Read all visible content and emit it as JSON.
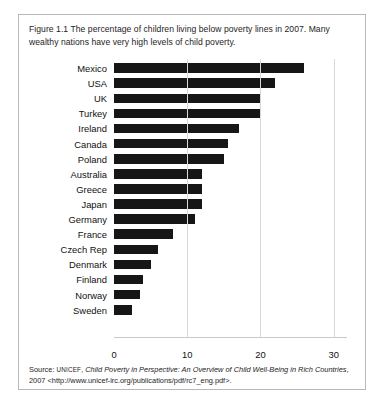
{
  "figure": {
    "caption": "Figure 1.1 The percentage of children living below poverty lines in 2007. Many wealthy nations have very high levels of child poverty.",
    "source_prefix": "Source: ",
    "source_publisher": "UNICEF",
    "source_comma": ", ",
    "source_title": "Child Poverty in Perspective: An Overview of Child Well-Being in Rich Countries",
    "source_year": ", 2007 ",
    "source_url": "<http://www.unicef-irc.org/publications/pdf/rc7_eng.pdf>."
  },
  "chart_data": {
    "type": "bar",
    "orientation": "horizontal",
    "title": "Figure 1.1 The percentage of children living below poverty lines in 2007. Many wealthy nations have very high levels of child poverty.",
    "xlabel": "",
    "ylabel": "",
    "xlim": [
      0,
      34
    ],
    "xticks": [
      0,
      10,
      20,
      30
    ],
    "xtick_labels": [
      "0",
      "10",
      "20",
      "30"
    ],
    "grid": true,
    "grid_axis": "x",
    "legend": false,
    "bar_color": "#161616",
    "categories": [
      "Mexico",
      "USA",
      "UK",
      "Turkey",
      "Ireland",
      "Canada",
      "Poland",
      "Australia",
      "Greece",
      "Japan",
      "Germany",
      "France",
      "Czech Rep",
      "Denmark",
      "Finland",
      "Norway",
      "Sweden"
    ],
    "values": [
      26.0,
      22.0,
      20.0,
      20.0,
      17.0,
      15.5,
      15.0,
      12.0,
      12.0,
      12.0,
      11.0,
      8.0,
      6.0,
      5.0,
      4.0,
      3.5,
      2.5
    ],
    "units": "percent"
  }
}
